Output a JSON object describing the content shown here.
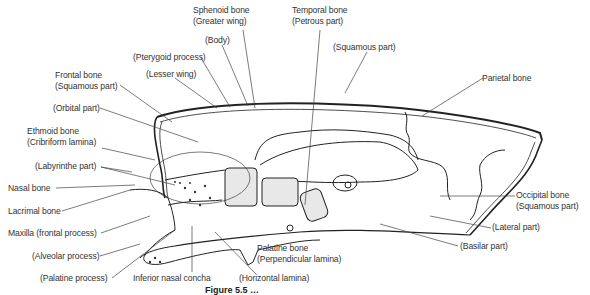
{
  "caption": "Figure 5.5 …",
  "labels": {
    "sphenoid": {
      "line1": "Sphenoid bone",
      "line2": "(Greater wing)"
    },
    "temporal": {
      "line1": "Temporal bone",
      "line2": "(Petrous part)"
    },
    "body": "(Body)",
    "pterygoid": "(Pterygoid process)",
    "lesser_wing": "(Lesser wing)",
    "squamous_temporal": "(Squamous part)",
    "frontal": {
      "line1": "Frontal bone",
      "line2": "(Squamous part)"
    },
    "orbital": "(Orbital part)",
    "parietal": "Parietal bone",
    "ethmoid": {
      "line1": "Ethmoid bone",
      "line2": "(Cribriform lamina)"
    },
    "labyrinthe": "(Labyrinthe part)",
    "nasal": "Nasal bone",
    "lacrimal": "Lacrimal bone",
    "maxilla": "Maxilla (frontal process)",
    "alveolar": "(Alveolar process)",
    "palatine_process": "(Palatine process)",
    "inferior_concha": "Inferior nasal concha",
    "horizontal_lamina": "(Horizontal lamina)",
    "palatine_bone": {
      "line1": "Palatine bone",
      "line2": "(Perpendicular lamina)"
    },
    "occipital": {
      "line1": "Occipital bone",
      "line2": "(Squamous part)"
    },
    "lateral_part": "(Lateral part)",
    "basilar_part": "(Basilar part)"
  }
}
